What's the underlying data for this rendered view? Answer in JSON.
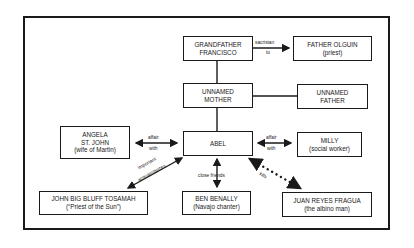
{
  "diagram": {
    "title": "",
    "nodes": {
      "grandfather": {
        "line1": "GRANDFATHER",
        "line2": "FRANCISCO"
      },
      "olguin": {
        "line1": "FATHER OLGUIN",
        "line2": "(priest)"
      },
      "mother": {
        "line1": "UNNAMED",
        "line2": "MOTHER"
      },
      "father": {
        "line1": "UNNAMED",
        "line2": "FATHER"
      },
      "angela": {
        "line1": "ANGELA",
        "line2": "ST. JOHN",
        "line3": "(wife of Martin)"
      },
      "abel": {
        "line1": "ABEL"
      },
      "milly": {
        "line1": "MILLY",
        "line2": "(social worker)"
      },
      "tosamah": {
        "line1": "JOHN BIG BLUFF TOSAMAH",
        "line2": "(“Priest of the Sun”)"
      },
      "benally": {
        "line1": "BEN BENALLY",
        "line2": "(Navajo chanter)"
      },
      "fragua": {
        "line1": "JUAN REYES FRAGUA",
        "line2": "(the albino man)"
      }
    },
    "edges": {
      "sacristan": {
        "top": "sacristan",
        "bottom": "to"
      },
      "angela_affair": {
        "top": "affair",
        "bottom": "with"
      },
      "milly_affair": {
        "top": "affair",
        "bottom": "with"
      },
      "tosamah": {
        "top": "important",
        "bottom": "acquaintances"
      },
      "benally": {
        "label": "close friends"
      },
      "fragua": {
        "label": "kills"
      }
    }
  }
}
